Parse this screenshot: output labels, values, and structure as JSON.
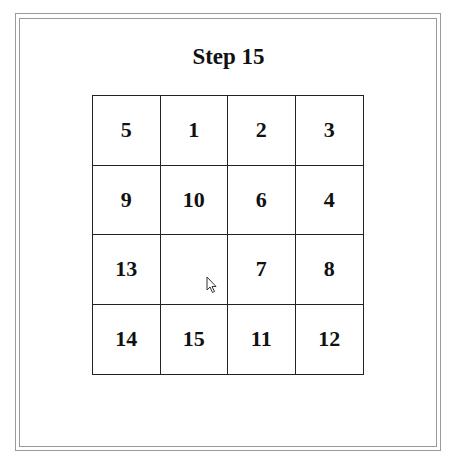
{
  "title": "Step 15",
  "board": {
    "cells": [
      "5",
      "1",
      "2",
      "3",
      "9",
      "10",
      "6",
      "4",
      "13",
      "",
      "7",
      "8",
      "14",
      "15",
      "11",
      "12"
    ]
  },
  "cursor": {
    "icon": "arrow-cursor-icon"
  }
}
